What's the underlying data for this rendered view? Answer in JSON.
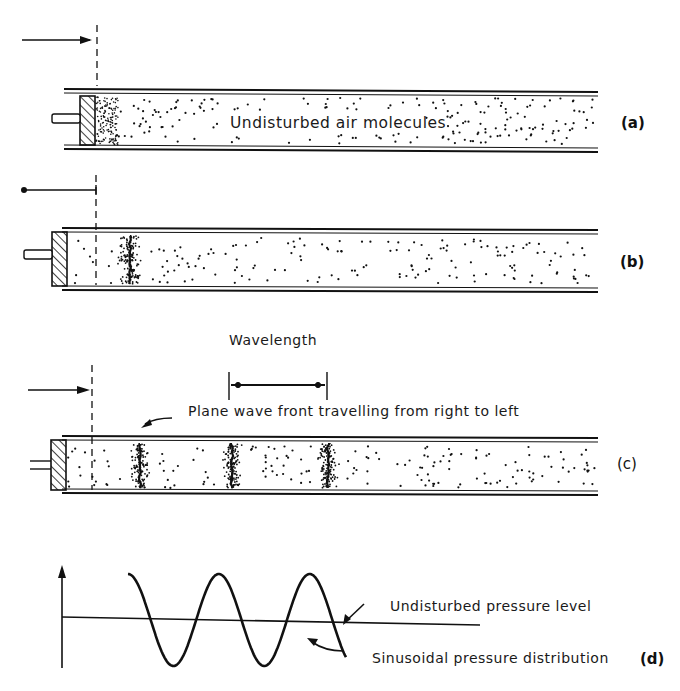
{
  "figure": {
    "panels": [
      {
        "id": "a",
        "label": "(a)",
        "caption": "Undisturbed air molecules"
      },
      {
        "id": "b",
        "label": "(b)"
      },
      {
        "id": "c",
        "label": "(c)",
        "wavelength_label": "Wavelength",
        "caption": "Plane wave front travelling from right to left"
      },
      {
        "id": "d",
        "label": "(d)",
        "upper_annotation": "Undisturbed pressure level",
        "lower_annotation": "Sinusoidal pressure distribution"
      }
    ]
  }
}
